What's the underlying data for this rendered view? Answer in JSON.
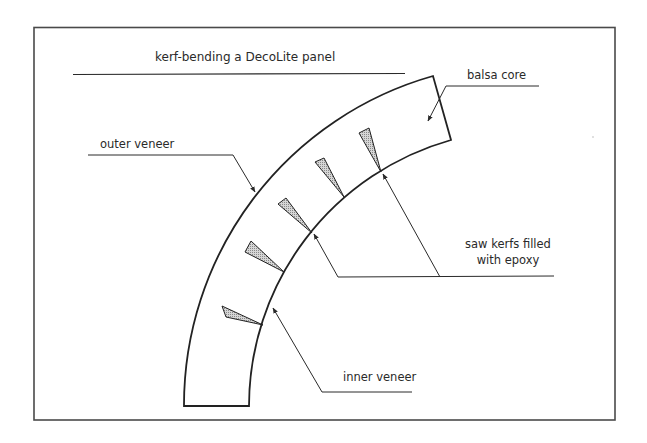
{
  "title": "kerf-bending a DecoLite panel",
  "labels": {
    "balsa_core": "balsa core",
    "outer_veneer": "outer veneer",
    "saw_kerfs_line1": "saw kerfs filled",
    "saw_kerfs_line2": "with epoxy",
    "inner_veneer": "inner veneer"
  },
  "colors": {
    "stroke": "#2a2a2a",
    "frame": "#4a4a4a",
    "kerf_fill": "#c8c8c8",
    "background": "#ffffff"
  },
  "panel": {
    "center": [
      526,
      406
    ],
    "outer_radius": 342,
    "inner_radius": 277,
    "kerf_count": 5
  }
}
